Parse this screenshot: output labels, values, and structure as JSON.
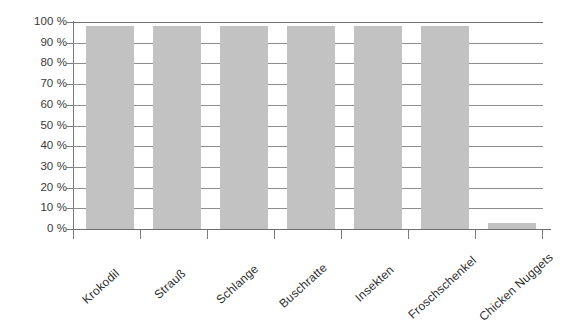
{
  "chart_data": {
    "type": "bar",
    "title": "",
    "subtitle": "",
    "xlabel": "",
    "ylabel": "",
    "categories": [
      "Krokodil",
      "Strauß",
      "Schlange",
      "Buschratte",
      "Insekten",
      "Froschschenkel",
      "Chicken Nuggets"
    ],
    "values": [
      98,
      98,
      98,
      98,
      98,
      98,
      3
    ],
    "ylim": [
      0,
      100
    ],
    "y_tick_values": [
      100,
      90,
      80,
      70,
      60,
      50,
      40,
      30,
      20,
      10,
      0
    ],
    "y_tick_labels": [
      "100 %",
      "90 %",
      "80 %",
      "70 %",
      "60 %",
      "50 %",
      "40 %",
      "30 %",
      "20 %",
      "10 %",
      "0 %"
    ],
    "grid": true,
    "grid_axis": "y",
    "legend": false,
    "legend_position": "none",
    "bar_color": "#c2c2c2",
    "axis_color": "#7a7a7a",
    "gridline_color": "#8d8d8d",
    "text_color": "#3a3a3a",
    "background_color": "#ffffff",
    "x_label_rotation": -42,
    "annotations": []
  }
}
